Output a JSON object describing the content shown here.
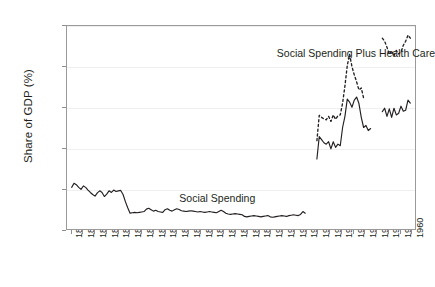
{
  "chart_data": {
    "type": "line",
    "title": "",
    "subtitle": "",
    "xlabel": "",
    "ylabel": "Share of GDP (%)",
    "xlim": [
      1813,
      1962
    ],
    "ylim": [
      0,
      10
    ],
    "grid": true,
    "grid_axis": "y",
    "legend_position": "inline-annotations",
    "yticks": [
      0,
      2,
      4,
      6,
      8,
      10
    ],
    "ytick_labels": [
      "0",
      "2",
      "4",
      "6",
      "8",
      "10"
    ],
    "xticks": [
      1815,
      1820,
      1825,
      1830,
      1835,
      1840,
      1845,
      1850,
      1855,
      1860,
      1865,
      1870,
      1875,
      1880,
      1885,
      1890,
      1895,
      1900,
      1905,
      1910,
      1915,
      1920,
      1925,
      1930,
      1935,
      1940,
      1945,
      1950,
      1955,
      1960
    ],
    "xtick_labels": [
      "1815",
      "1820",
      "1825",
      "1830",
      "1835",
      "1840",
      "1845",
      "1850",
      "1855",
      "1860",
      "1865",
      "1870",
      "1875",
      "1880",
      "1885",
      "1890",
      "1895",
      "1900",
      "1905",
      "1910",
      "1915",
      "1920",
      "1925",
      "1930",
      "1935",
      "1940",
      "1945",
      "1950",
      "1955",
      "1960"
    ],
    "annotations": [
      {
        "name": "social-spending-label",
        "text": "Social Spending",
        "x": 1877,
        "y": 1.55
      },
      {
        "name": "social-spending-plus-health-care-label",
        "text": "Social Spending Plus Health Care",
        "x": 1936,
        "y": 8.62
      }
    ],
    "series": [
      {
        "name": "Social Spending",
        "style": "solid",
        "color": "#231f20",
        "segments": [
          {
            "x": [
              1815,
              1816,
              1817,
              1818,
              1819,
              1820,
              1821,
              1822,
              1823,
              1824,
              1825,
              1826,
              1827,
              1828,
              1829,
              1830,
              1831,
              1832,
              1833,
              1834,
              1835,
              1836,
              1837,
              1838,
              1839,
              1840,
              1841,
              1842,
              1843,
              1844,
              1845,
              1846,
              1847,
              1848,
              1849,
              1850,
              1851,
              1852,
              1853,
              1854,
              1855,
              1856,
              1857,
              1858,
              1859,
              1860,
              1861,
              1862,
              1863,
              1864,
              1865,
              1866,
              1867,
              1868,
              1869,
              1870,
              1871,
              1872,
              1873,
              1874,
              1875,
              1876,
              1877,
              1878,
              1879,
              1880,
              1881,
              1882,
              1883,
              1884,
              1885,
              1886,
              1887,
              1888,
              1889,
              1890,
              1891,
              1892,
              1893,
              1894,
              1895,
              1896,
              1897,
              1898,
              1899,
              1900,
              1901,
              1902,
              1903,
              1904,
              1905,
              1906,
              1907,
              1908,
              1909,
              1910,
              1911,
              1912,
              1913,
              1914,
              1915
            ],
            "y": [
              2.05,
              2.25,
              2.18,
              2.05,
              1.95,
              2.12,
              2.05,
              1.92,
              1.8,
              1.7,
              1.62,
              1.78,
              1.88,
              1.8,
              1.6,
              1.72,
              1.88,
              1.8,
              1.92,
              1.85,
              1.88,
              1.9,
              1.7,
              1.35,
              1.05,
              0.78,
              0.8,
              0.82,
              0.8,
              0.82,
              0.84,
              0.86,
              0.98,
              1.02,
              0.95,
              0.88,
              0.92,
              0.86,
              0.84,
              0.82,
              0.95,
              1.0,
              0.92,
              0.88,
              0.95,
              1.0,
              0.96,
              0.9,
              0.88,
              0.86,
              0.88,
              0.9,
              0.88,
              0.86,
              0.84,
              0.86,
              0.84,
              0.82,
              0.84,
              0.86,
              0.84,
              0.82,
              0.8,
              0.86,
              0.92,
              0.86,
              0.78,
              0.74,
              0.72,
              0.74,
              0.76,
              0.74,
              0.72,
              0.7,
              0.62,
              0.6,
              0.62,
              0.64,
              0.66,
              0.64,
              0.62,
              0.6,
              0.62,
              0.64,
              0.66,
              0.6,
              0.58,
              0.6,
              0.62,
              0.64,
              0.66,
              0.64,
              0.62,
              0.66,
              0.68,
              0.7,
              0.68,
              0.66,
              0.72,
              0.86,
              0.78,
              0.8,
              1.08,
              1.12,
              1.1
            ]
          },
          {
            "x": [
              1920,
              1921,
              1922,
              1923,
              1924,
              1925,
              1926,
              1927,
              1928,
              1929,
              1930,
              1931,
              1932,
              1933,
              1934,
              1935,
              1936,
              1937,
              1938,
              1939,
              1940,
              1941,
              1942,
              1943
            ],
            "y": [
              3.45,
              4.55,
              4.4,
              4.25,
              4.18,
              4.3,
              3.95,
              4.3,
              4.02,
              4.18,
              4.1,
              5.0,
              5.55,
              6.4,
              6.25,
              6.0,
              6.35,
              6.5,
              6.18,
              5.5,
              5.0,
              5.1,
              4.85,
              4.95
            ]
          },
          {
            "x": [
              1948,
              1949,
              1950,
              1951,
              1952,
              1953,
              1954,
              1955,
              1956,
              1957,
              1958,
              1959,
              1960
            ],
            "y": [
              5.78,
              5.95,
              5.55,
              5.92,
              5.5,
              5.95,
              5.62,
              5.7,
              6.05,
              5.8,
              5.85,
              6.35,
              6.2
            ]
          }
        ]
      },
      {
        "name": "Social Spending Plus Health Care",
        "style": "dashed",
        "color": "#231f20",
        "segments": [
          {
            "x": [
              1920,
              1921,
              1922,
              1923,
              1924,
              1925,
              1926,
              1927,
              1928,
              1929,
              1930,
              1931,
              1932,
              1933,
              1934,
              1935,
              1936,
              1937,
              1938,
              1939,
              1940
            ],
            "y": [
              4.35,
              5.6,
              5.5,
              5.42,
              5.38,
              5.55,
              5.3,
              5.62,
              5.4,
              5.58,
              5.62,
              6.2,
              7.05,
              8.05,
              8.6,
              8.0,
              7.6,
              7.25,
              6.85,
              6.95,
              6.45
            ]
          },
          {
            "x": [
              1948,
              1949,
              1950,
              1951,
              1952,
              1953,
              1954,
              1955,
              1956,
              1957,
              1958,
              1959,
              1960
            ],
            "y": [
              9.4,
              9.25,
              8.95,
              8.6,
              8.78,
              8.52,
              8.8,
              8.62,
              8.72,
              9.05,
              9.25,
              9.55,
              9.4
            ]
          }
        ]
      }
    ]
  },
  "axis": {
    "y_title": "Share of GDP (%)"
  }
}
